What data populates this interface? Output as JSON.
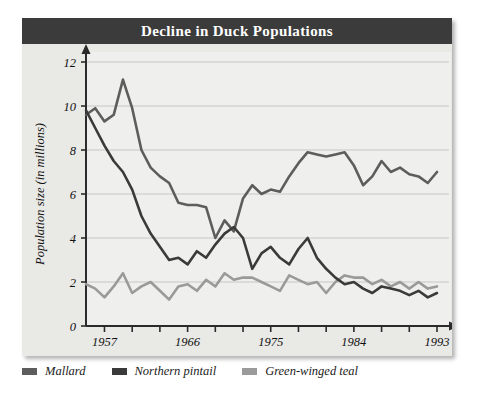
{
  "title": "Decline in Duck Populations",
  "legend": {
    "items": [
      {
        "label": "Mallard",
        "color": "#5d5d5d",
        "key": "mallard"
      },
      {
        "label": "Northern pintail",
        "color": "#3a3a3a",
        "key": "pintail"
      },
      {
        "label": "Green-winged teal",
        "color": "#9a9a9a",
        "key": "teal"
      }
    ]
  },
  "chart_data": {
    "type": "line",
    "title": "Decline in Duck Populations",
    "xlabel": "Year",
    "ylabel": "Population size (in millions)",
    "xlim": [
      1955,
      1993
    ],
    "ylim": [
      0,
      12
    ],
    "yticks": [
      0,
      2,
      4,
      6,
      8,
      10,
      12
    ],
    "xticks": [
      1957,
      1960,
      1963,
      1966,
      1969,
      1972,
      1975,
      1978,
      1981,
      1984,
      1987,
      1990,
      1993
    ],
    "xtick_labels": [
      "1957",
      "",
      "",
      "1966",
      "",
      "",
      "1975",
      "",
      "",
      "1984",
      "",
      "",
      "1993"
    ],
    "grid": "horizontal",
    "legend_position": "below",
    "x": [
      1955,
      1956,
      1957,
      1958,
      1959,
      1960,
      1961,
      1962,
      1963,
      1964,
      1965,
      1966,
      1967,
      1968,
      1969,
      1970,
      1971,
      1972,
      1973,
      1974,
      1975,
      1976,
      1977,
      1978,
      1979,
      1980,
      1981,
      1982,
      1983,
      1984,
      1985,
      1986,
      1987,
      1988,
      1989,
      1990,
      1991,
      1992,
      1993
    ],
    "series": [
      {
        "name": "Mallard",
        "color": "#5d5d5d",
        "values": [
          9.6,
          9.9,
          9.3,
          9.6,
          11.2,
          9.9,
          8.0,
          7.2,
          6.8,
          6.5,
          5.6,
          5.5,
          5.5,
          5.4,
          4.0,
          4.8,
          4.3,
          5.8,
          6.4,
          6.0,
          6.2,
          6.1,
          6.8,
          7.4,
          7.9,
          7.8,
          7.7,
          7.8,
          7.9,
          7.3,
          6.4,
          6.8,
          7.5,
          7.0,
          7.2,
          6.9,
          6.8,
          6.5,
          7.0
        ]
      },
      {
        "name": "Northern pintail",
        "color": "#3a3a3a",
        "values": [
          9.8,
          9.0,
          8.2,
          7.5,
          7.0,
          6.2,
          5.0,
          4.2,
          3.6,
          3.0,
          3.1,
          2.8,
          3.4,
          3.1,
          3.7,
          4.2,
          4.5,
          4.0,
          2.6,
          3.3,
          3.6,
          3.1,
          2.8,
          3.5,
          4.0,
          3.1,
          2.6,
          2.2,
          1.9,
          2.0,
          1.7,
          1.5,
          1.8,
          1.7,
          1.6,
          1.4,
          1.6,
          1.3,
          1.5
        ]
      },
      {
        "name": "Green-winged teal",
        "color": "#9a9a9a",
        "values": [
          1.9,
          1.7,
          1.3,
          1.8,
          2.4,
          1.5,
          1.8,
          2.0,
          1.6,
          1.2,
          1.8,
          1.9,
          1.6,
          2.1,
          1.8,
          2.4,
          2.1,
          2.2,
          2.2,
          2.0,
          1.8,
          1.6,
          2.3,
          2.1,
          1.9,
          2.0,
          1.5,
          2.0,
          2.3,
          2.2,
          2.2,
          1.9,
          2.1,
          1.8,
          2.0,
          1.7,
          2.0,
          1.7,
          1.8
        ]
      }
    ]
  }
}
